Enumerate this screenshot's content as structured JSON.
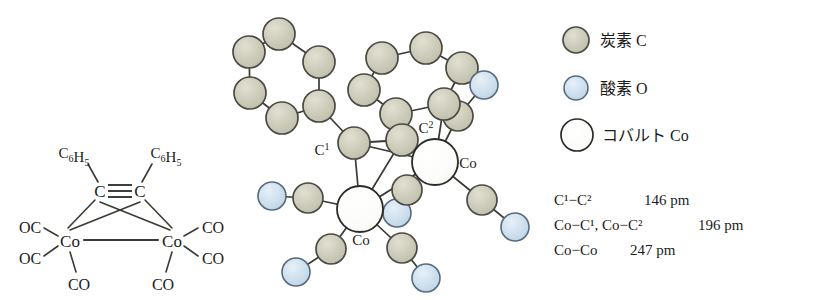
{
  "figure": {
    "background": "#ffffff",
    "atom_colors": {
      "carbon": "#c9c7b5",
      "carbon_stroke": "#4a4a42",
      "oxygen": "#cadcea",
      "oxygen_stroke": "#566b7c",
      "cobalt": "#fdfdfb",
      "cobalt_stroke": "#2b2b28",
      "bond": "#3a3a33"
    }
  },
  "structural_formula": {
    "name": "dicobalt-hexacarbonyl-diphenylacetylene",
    "substituent_left": "C6H5",
    "substituent_right": "C6H5",
    "alkyne_left": "C",
    "alkyne_right": "C",
    "triple_bond_symbol": "≡",
    "metal_left": "Co",
    "metal_right": "Co",
    "carbonyls": {
      "left_upper": "OC",
      "left_lower": "OC",
      "left_bottom": "CO",
      "right_upper": "CO",
      "right_lower": "CO",
      "right_bottom": "CO"
    }
  },
  "model": {
    "labels": {
      "c1": "C",
      "c1_sup": "1",
      "c2": "C",
      "c2_sup": "2",
      "cobalt_upper": "Co",
      "cobalt_lower": "Co"
    },
    "atoms": {
      "phenyl_left": [
        {
          "id": "pl1",
          "element": "C",
          "x": 49,
          "y": 34,
          "r": 16
        },
        {
          "id": "pl2",
          "element": "C",
          "x": 19,
          "y": 52,
          "r": 16
        },
        {
          "id": "pl3",
          "element": "C",
          "x": 20,
          "y": 93,
          "r": 16
        },
        {
          "id": "pl4",
          "element": "C",
          "x": 52,
          "y": 118,
          "r": 16
        },
        {
          "id": "pl5",
          "element": "C",
          "x": 89,
          "y": 106,
          "r": 16
        },
        {
          "id": "pl6",
          "element": "C",
          "x": 89,
          "y": 62,
          "r": 16
        }
      ],
      "phenyl_right": [
        {
          "id": "pr1",
          "element": "C",
          "x": 196,
          "y": 48,
          "r": 16
        },
        {
          "id": "pr2",
          "element": "C",
          "x": 152,
          "y": 58,
          "r": 16
        },
        {
          "id": "pr3",
          "element": "C",
          "x": 134,
          "y": 90,
          "r": 16
        },
        {
          "id": "pr4",
          "element": "C",
          "x": 166,
          "y": 114,
          "r": 16
        },
        {
          "id": "pr5",
          "element": "C",
          "x": 214,
          "y": 104,
          "r": 16
        },
        {
          "id": "pr6",
          "element": "C",
          "x": 232,
          "y": 68,
          "r": 16
        }
      ],
      "core": [
        {
          "id": "c1",
          "element": "C",
          "x": 124,
          "y": 143,
          "r": 16
        },
        {
          "id": "c2",
          "element": "C",
          "x": 172,
          "y": 140,
          "r": 16
        },
        {
          "id": "co_upper",
          "element": "Co",
          "x": 205,
          "y": 162,
          "r": 23
        },
        {
          "id": "co_lower",
          "element": "Co",
          "x": 130,
          "y": 209,
          "r": 23
        }
      ],
      "carbonyls": [
        {
          "id": "co_lig1_c",
          "element": "C",
          "x": 78,
          "y": 198,
          "r": 15
        },
        {
          "id": "co_lig1_o",
          "element": "O",
          "x": 42,
          "y": 196,
          "r": 14
        },
        {
          "id": "co_lig2_c",
          "element": "C",
          "x": 101,
          "y": 249,
          "r": 15
        },
        {
          "id": "co_lig2_o",
          "element": "O",
          "x": 66,
          "y": 272,
          "r": 14
        },
        {
          "id": "co_lig3_c",
          "element": "C",
          "x": 172,
          "y": 248,
          "r": 15
        },
        {
          "id": "co_lig3_o",
          "element": "O",
          "x": 196,
          "y": 278,
          "r": 14
        },
        {
          "id": "co_lig4_c",
          "element": "C",
          "x": 177,
          "y": 190,
          "r": 15
        },
        {
          "id": "co_lig4_o",
          "element": "O",
          "x": 167,
          "y": 213,
          "r": 14
        },
        {
          "id": "co_lig5_c",
          "element": "C",
          "x": 252,
          "y": 200,
          "r": 15
        },
        {
          "id": "co_lig5_o",
          "element": "O",
          "x": 285,
          "y": 227,
          "r": 14
        },
        {
          "id": "co_lig6_c",
          "element": "C",
          "x": 228,
          "y": 116,
          "r": 15
        },
        {
          "id": "co_lig6_o",
          "element": "O",
          "x": 254,
          "y": 85,
          "r": 14
        }
      ]
    }
  },
  "legend": {
    "items": [
      {
        "id": "carbon",
        "symbol_name": "carbon-sphere",
        "label": "炭素 C"
      },
      {
        "id": "oxygen",
        "symbol_name": "oxygen-sphere",
        "label": "酸素 O"
      },
      {
        "id": "cobalt",
        "symbol_name": "cobalt-sphere",
        "label": "コバルト Co"
      }
    ]
  },
  "metrics": {
    "rows": [
      {
        "id": "c1-c2",
        "bond": "C¹−C²",
        "value": "146 pm"
      },
      {
        "id": "co-c",
        "bond": "Co−C¹,  Co−C²",
        "value": "196 pm"
      },
      {
        "id": "co-co",
        "bond": "Co−Co",
        "value": "247 pm"
      }
    ]
  }
}
